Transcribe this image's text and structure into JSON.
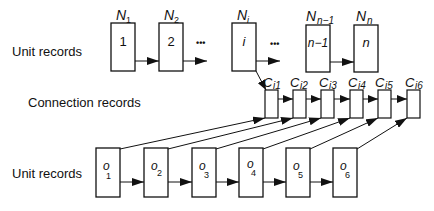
{
  "labels": {
    "top_row": "Unit records",
    "middle_row": "Connection records",
    "bottom_row": "Unit records"
  },
  "top_units": [
    {
      "title": "N",
      "sub": "1",
      "content": "1"
    },
    {
      "title": "N",
      "sub": "2",
      "content": "2"
    },
    {
      "title": "N",
      "sub": "i",
      "content": "i"
    },
    {
      "title": "N",
      "sub": "n−1",
      "content": "n−1"
    },
    {
      "title": "N",
      "sub": "n",
      "content": "n"
    }
  ],
  "ellipsis": "•••",
  "connections": [
    {
      "title": "C",
      "sub": "i1"
    },
    {
      "title": "C",
      "sub": "i2"
    },
    {
      "title": "C",
      "sub": "i3"
    },
    {
      "title": "C",
      "sub": "i4"
    },
    {
      "title": "C",
      "sub": "i5"
    },
    {
      "title": "C",
      "sub": "i6"
    }
  ],
  "bottom_units": [
    {
      "title": "o",
      "sub": "1"
    },
    {
      "title": "o",
      "sub": "2"
    },
    {
      "title": "o",
      "sub": "3"
    },
    {
      "title": "o",
      "sub": "4"
    },
    {
      "title": "o",
      "sub": "5"
    },
    {
      "title": "o",
      "sub": "6"
    }
  ]
}
